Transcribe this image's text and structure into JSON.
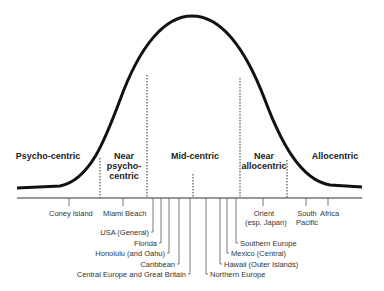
{
  "segments": [
    {
      "label": "Psycho-centric"
    },
    {
      "label": "Near psycho-centric",
      "lines": [
        "Near",
        "psycho-",
        "centric"
      ]
    },
    {
      "label": "Mid-centric"
    },
    {
      "label": "Near allocentric",
      "lines": [
        "Near",
        "allocentric"
      ]
    },
    {
      "label": "Allocentric"
    }
  ],
  "destinations": [
    {
      "label": "Coney Island"
    },
    {
      "label": "Miami Beach"
    },
    {
      "label": "USA (General)"
    },
    {
      "label": "Florida"
    },
    {
      "label": "Honolulu (and Oahu)"
    },
    {
      "label": "Caribbean"
    },
    {
      "label": "Central Europe and Great Britain"
    },
    {
      "label": "Northern Europe"
    },
    {
      "label": "Hawaii (Outer Islands)"
    },
    {
      "label": "Mexico (Central)"
    },
    {
      "label": "Southern Europe"
    },
    {
      "label": "Orient",
      "sub": "(esp. Japan)"
    },
    {
      "label": "South",
      "sub": "Pacific"
    },
    {
      "label": "Africa"
    }
  ]
}
